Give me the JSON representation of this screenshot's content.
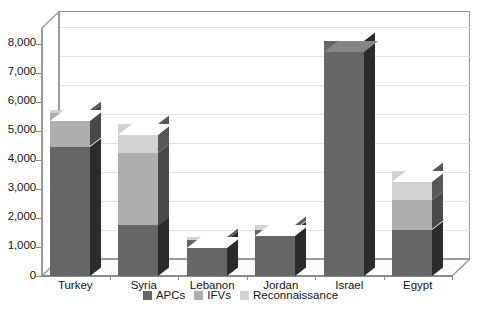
{
  "chart_data": {
    "type": "bar",
    "subtype": "stacked-column-3d",
    "title": "",
    "xlabel": "",
    "ylabel": "",
    "categories": [
      "Turkey",
      "Syria",
      "Lebanon",
      "Jordan",
      "Israel",
      "Egypt"
    ],
    "series": [
      {
        "name": "APCs",
        "color": "#666666",
        "values": [
          4450,
          1750,
          1250,
          1600,
          8100,
          1600
        ]
      },
      {
        "name": "IFVs",
        "color": "#aeaeae",
        "values": [
          1150,
          2500,
          0,
          0,
          0,
          1000
        ]
      },
      {
        "name": "Reconnaissance",
        "color": "#d2d2d2",
        "values": [
          100,
          1000,
          100,
          150,
          0,
          1000
        ]
      }
    ],
    "totals": [
      5700,
      5250,
      1350,
      1750,
      8100,
      3600
    ],
    "ylim": [
      0,
      8000
    ],
    "ytick_labels": [
      "0",
      "1,000",
      "2,000",
      "3,000",
      "4,000",
      "5,000",
      "6,000",
      "7,000",
      "8,000"
    ],
    "ytick_values": [
      0,
      1000,
      2000,
      3000,
      4000,
      5000,
      6000,
      7000,
      8000
    ],
    "grid": true,
    "legend_position": "bottom-center"
  },
  "legend": {
    "items": [
      {
        "label": "APCs",
        "color": "#666666"
      },
      {
        "label": "IFVs",
        "color": "#aeaeae"
      },
      {
        "label": "Reconnaissance",
        "color": "#d2d2d2"
      }
    ]
  }
}
